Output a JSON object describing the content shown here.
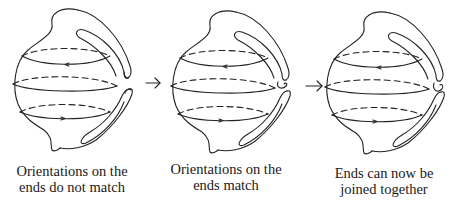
{
  "diagram": {
    "type": "sequence of three topological figures",
    "stroke_color": "#222222",
    "background_color": "#ffffff",
    "panels": [
      {
        "id": "panel-1",
        "caption_lines": [
          "Orientations on the",
          "ends do not match"
        ],
        "circle_orientations": [
          "left",
          "none",
          "right"
        ],
        "tube_ends": "separated, orientations mismatched"
      },
      {
        "id": "panel-2",
        "caption_lines": [
          "Orientations on the",
          "ends match"
        ],
        "circle_orientations": [
          "left",
          "none",
          "right"
        ],
        "tube_ends": "top end twisted so orientations match"
      },
      {
        "id": "panel-3",
        "caption_lines": [
          "Ends can now be",
          "joined together"
        ],
        "circle_orientations": [
          "left",
          "none",
          "right"
        ],
        "tube_ends": "ends brought together and joined"
      }
    ],
    "transition_arrows": [
      {
        "from": "panel-1",
        "to": "panel-2",
        "glyph": "→"
      },
      {
        "from": "panel-2",
        "to": "panel-3",
        "glyph": "→"
      }
    ]
  }
}
